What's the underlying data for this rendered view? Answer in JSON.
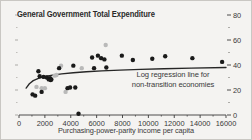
{
  "figure": {
    "background_color": "#f4f3f1",
    "border_color": "#c9c7c3",
    "title": "General Government Total Expenditure"
  },
  "annotation": {
    "line1": "Log regression line for",
    "line2": "non-transition economies"
  },
  "chart_data": {
    "type": "scatter",
    "title": "General Government Total Expenditure",
    "subtitle": "",
    "xlabel": "Purchasing-power-parity income per capita",
    "ylabel": "",
    "xlim": [
      0,
      16000
    ],
    "ylim": [
      0,
      80
    ],
    "xticks": [
      0,
      2000,
      4000,
      6000,
      8000,
      10000,
      12000,
      14000,
      16000
    ],
    "xtick_labels": [
      "0",
      "2000",
      "4000",
      "6000",
      "8000",
      "10000",
      "12000",
      "14000",
      "16000"
    ],
    "xticks_minor": [
      1000,
      3000,
      5000,
      7000,
      9000,
      11000,
      13000,
      15000
    ],
    "yticks": [
      0,
      20,
      40,
      60,
      80
    ],
    "ytick_labels": [
      "0",
      "20",
      "40",
      "60",
      "80"
    ],
    "yticks_minor": [
      10,
      30,
      50,
      70
    ],
    "y_axis_position": "right",
    "grid": false,
    "legend": false,
    "series": [
      {
        "name": "Non-transition economies",
        "marker": "circle",
        "color": "#1a1a1a",
        "points": [
          [
            1050,
            16.5
          ],
          [
            1250,
            15.5
          ],
          [
            1500,
            35.0
          ],
          [
            1600,
            31.0
          ],
          [
            1750,
            18.5
          ],
          [
            1900,
            30.5
          ],
          [
            2150,
            30.0
          ],
          [
            2300,
            28.5
          ],
          [
            2400,
            29.5
          ],
          [
            2450,
            28.0
          ],
          [
            2500,
            28.5
          ],
          [
            3100,
            37.5
          ],
          [
            3750,
            21.5
          ],
          [
            3950,
            22.0
          ],
          [
            4200,
            39.5
          ],
          [
            4350,
            22.0
          ],
          [
            4600,
            1.0
          ],
          [
            5650,
            46.0
          ],
          [
            5800,
            37.5
          ],
          [
            6100,
            47.5
          ],
          [
            6350,
            45.5
          ],
          [
            6600,
            44.5
          ],
          [
            6750,
            38.0
          ],
          [
            7950,
            47.5
          ],
          [
            8800,
            44.0
          ],
          [
            10300,
            45.0
          ],
          [
            11300,
            47.0
          ],
          [
            13400,
            45.5
          ],
          [
            15700,
            42.5
          ]
        ]
      },
      {
        "name": "Transition economies",
        "marker": "circle",
        "color": "#b9b9b9",
        "points": [
          [
            1350,
            22.5
          ],
          [
            1750,
            21.5
          ],
          [
            2000,
            21.5
          ],
          [
            2750,
            31.5
          ],
          [
            2900,
            32.0
          ],
          [
            3250,
            39.5
          ],
          [
            3600,
            18.5
          ],
          [
            4850,
            37.5
          ],
          [
            6700,
            56.0
          ]
        ]
      }
    ],
    "fit_line": {
      "name": "Log regression line for non-transition economies",
      "type": "log",
      "color": "#262626",
      "points": [
        [
          550,
          21.5
        ],
        [
          800,
          25.0
        ],
        [
          1100,
          27.5
        ],
        [
          1500,
          29.3
        ],
        [
          2000,
          30.8
        ],
        [
          2600,
          31.9
        ],
        [
          3300,
          32.9
        ],
        [
          4200,
          33.8
        ],
        [
          5200,
          34.6
        ],
        [
          6400,
          35.3
        ],
        [
          7800,
          35.9
        ],
        [
          9400,
          36.5
        ],
        [
          11200,
          37.0
        ],
        [
          13300,
          37.5
        ],
        [
          16000,
          38.0
        ]
      ]
    }
  }
}
